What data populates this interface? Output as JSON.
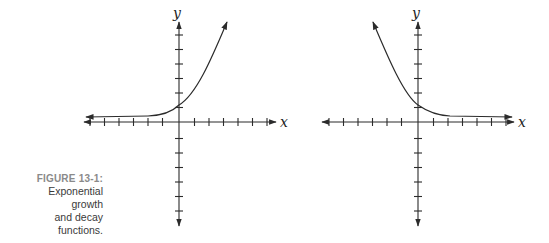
{
  "caption": {
    "figure_label": "FIGURE 13-1:",
    "lines": [
      "Exponential",
      "growth",
      "and decay",
      "functions."
    ]
  },
  "graphs": [
    {
      "name": "exponential-growth",
      "x_label": "x",
      "y_label": "y",
      "ticks_negative_x": 6,
      "ticks_positive_x": 6,
      "ticks_positive_y": 6,
      "ticks_negative_y": 6,
      "y_intercept": 1,
      "asymptote": "y = 0 (approached as x → −∞)",
      "curve_direction": "increasing"
    },
    {
      "name": "exponential-decay",
      "x_label": "x",
      "y_label": "y",
      "ticks_negative_x": 6,
      "ticks_positive_x": 6,
      "ticks_positive_y": 6,
      "ticks_negative_y": 6,
      "y_intercept": 1,
      "asymptote": "y = 0 (approached as x → +∞)",
      "curve_direction": "decreasing"
    }
  ],
  "colors": {
    "ink": "#2b2b2b",
    "caption_label": "#8a8a8a",
    "caption_text": "#3a3a3a"
  }
}
